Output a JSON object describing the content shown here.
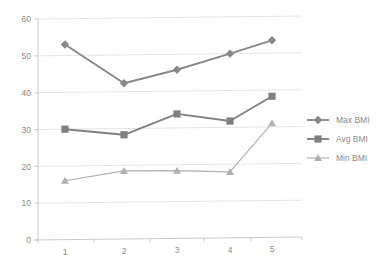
{
  "chart_data": {
    "type": "line",
    "title": "",
    "xlabel": "",
    "ylabel": "",
    "categories": [
      "1",
      "2",
      "3",
      "4",
      "5"
    ],
    "x": [
      1,
      2,
      3,
      4,
      5
    ],
    "ylim": [
      0,
      60
    ],
    "xlim": [
      0.5,
      5.5
    ],
    "yticks": [
      "0",
      "10",
      "20",
      "30",
      "40",
      "50",
      "60"
    ],
    "ytick_values": [
      0,
      10,
      20,
      30,
      40,
      50,
      60
    ],
    "xticks": [
      "1",
      "2",
      "3",
      "4",
      "5"
    ],
    "grid": "horizontal",
    "legend_position": "right",
    "series": [
      {
        "name": "Max BMI",
        "marker": "diamond",
        "color": "#888888",
        "values": [
          53,
          42.3,
          45.8,
          50,
          53.5
        ]
      },
      {
        "name": "Avg BMI",
        "marker": "square",
        "color": "#808080",
        "values": [
          30,
          28.3,
          33.8,
          31.7,
          38.3
        ]
      },
      {
        "name": "Min BMI",
        "marker": "triangle",
        "color": "#b0b0b0",
        "values": [
          16,
          18.5,
          18.4,
          17.9,
          31
        ]
      }
    ]
  },
  "legend": {
    "items": [
      {
        "label": "Max BMI",
        "marker": "diamond",
        "color": "#888888"
      },
      {
        "label": "Avg BMI",
        "marker": "square",
        "color": "#808080"
      },
      {
        "label": "Min BMI",
        "marker": "triangle",
        "color": "#b0b0b0"
      }
    ]
  },
  "colors": {
    "background": "#ffffff",
    "gridline": "#d9d9d9",
    "axis": "#bdbdbd",
    "text": "#8a8a8a",
    "max_series": "#888888",
    "avg_series": "#808080",
    "min_series": "#b0b0b0"
  }
}
